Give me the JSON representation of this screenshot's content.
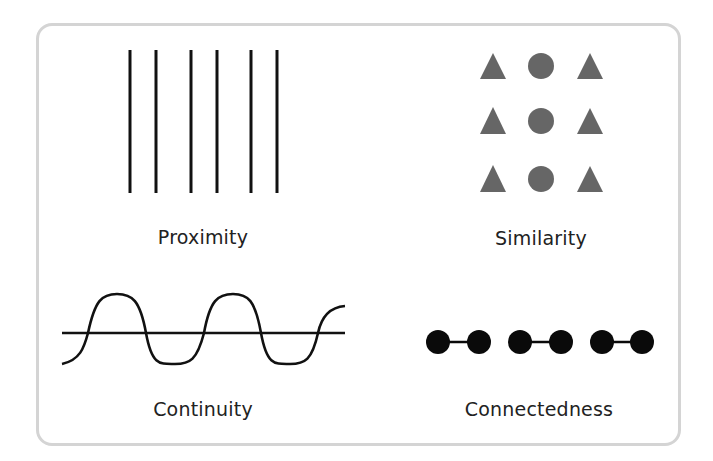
{
  "panels": [
    {
      "label": "Proximity",
      "figure": "six vertical lines grouped in pairs"
    },
    {
      "label": "Similarity",
      "figure": "3x3 grid: triangles in outer columns, circles in middle column"
    },
    {
      "label": "Continuity",
      "figure": "sine wave crossing a horizontal line"
    },
    {
      "label": "Connectedness",
      "figure": "six dots connected in three pairs"
    }
  ],
  "colors": {
    "frame": "#d4d4d4",
    "ink": "#111111",
    "shape_fill": "#666666",
    "text": "#222222"
  }
}
